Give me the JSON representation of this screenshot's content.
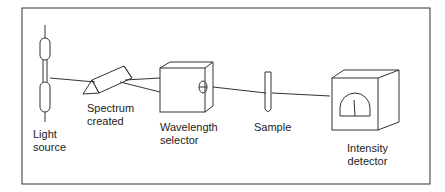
{
  "diagram": {
    "labels": {
      "light_source": [
        "Light",
        "source"
      ],
      "spectrum": [
        "Spectrum",
        "created"
      ],
      "wavelength": [
        "Wavelength",
        "selector"
      ],
      "sample": "Sample",
      "detector": [
        "Intensity",
        "detector"
      ]
    },
    "colors": {
      "line": "#333333",
      "background": "#ffffff"
    }
  }
}
